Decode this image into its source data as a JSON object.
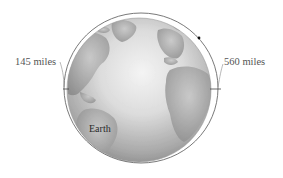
{
  "diagram": {
    "labels": {
      "perigee": "145 miles",
      "apogee": "560 miles",
      "planet": "Earth"
    },
    "elements": {
      "planet": "globe (Earth, Atlantic hemisphere view)",
      "orbit": "ellipse around Earth",
      "satellite": "small dot on orbit",
      "markers": [
        "left altitude tick",
        "right altitude tick"
      ]
    },
    "colors": {
      "orbit_line": "#6a6a6a",
      "globe_light": "#f2f2f2",
      "globe_dark": "#8a8a8a",
      "land": "#9c9c9c",
      "text": "#555555"
    }
  }
}
